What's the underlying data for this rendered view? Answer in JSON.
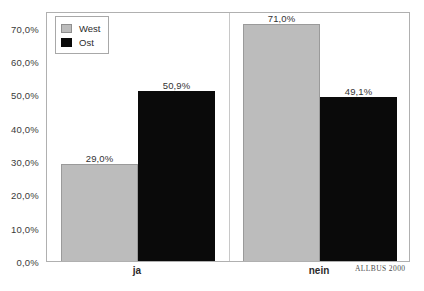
{
  "chart_data": {
    "type": "bar",
    "title": "",
    "subtitle": "",
    "xlabel": "",
    "ylabel": "",
    "categories": [
      "ja",
      "nein"
    ],
    "series": [
      {
        "name": "West",
        "color": "#bcbcbc",
        "values": [
          29.0,
          71.0
        ],
        "labels": [
          "29,0%",
          "71,0%"
        ]
      },
      {
        "name": "Ost",
        "color": "#0a0a0a",
        "values": [
          50.9,
          49.1
        ],
        "labels": [
          "50,9%",
          "49,1%"
        ]
      }
    ],
    "ylim": [
      0,
      75
    ],
    "yticks": [
      0,
      10,
      20,
      30,
      40,
      50,
      60,
      70
    ],
    "ytick_labels": [
      "0,0%",
      "10,0%",
      "20,0%",
      "30,0%",
      "40,0%",
      "50,0%",
      "60,0%",
      "70,0%"
    ],
    "grid": false,
    "legend_position": "top-left",
    "annotations": [
      "ALLBUS 2000"
    ]
  },
  "legend": {
    "items": [
      {
        "label": "West",
        "swatch": "west-swatch"
      },
      {
        "label": "Ost",
        "swatch": "ost-swatch"
      }
    ]
  },
  "source": {
    "text": "ALLBUS 2000"
  }
}
